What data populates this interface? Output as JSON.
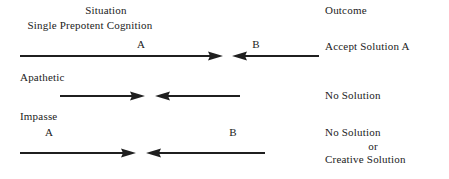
{
  "figure": {
    "background_color": "#ffffff",
    "ink_color": "#1f1f1f",
    "columns": {
      "situation_header": "Situation",
      "outcome_header": "Outcome"
    },
    "rows": [
      {
        "id": "single-prepotent-cognition",
        "situation_label": "Single Prepotent Cognition",
        "arrow_a_label": "A",
        "arrow_b_label": "B",
        "outcome_lines": [
          "Accept Solution A"
        ]
      },
      {
        "id": "apathetic",
        "situation_label": "Apathetic",
        "arrow_a_label": "",
        "arrow_b_label": "",
        "outcome_lines": [
          "No Solution"
        ]
      },
      {
        "id": "impasse",
        "situation_label": "Impasse",
        "arrow_a_label": "A",
        "arrow_b_label": "B",
        "outcome_lines": [
          "No Solution",
          "or",
          "Creative Solution"
        ]
      }
    ]
  }
}
